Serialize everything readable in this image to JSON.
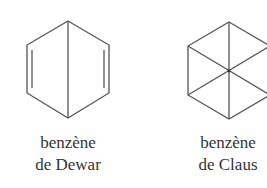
{
  "structures": [
    {
      "id": "dewar",
      "name_line1": "benzène",
      "name_line2": "de Dewar",
      "description": "Hexagon with central vertical bond and two double bonds on left and right sides"
    },
    {
      "id": "claus",
      "name_line1": "benzène",
      "name_line2": "de Claus",
      "description": "Hexagon with three diagonals crossing at the center"
    }
  ],
  "colors": {
    "stroke": "#555555",
    "text": "#333333",
    "background": "#ffffff"
  }
}
